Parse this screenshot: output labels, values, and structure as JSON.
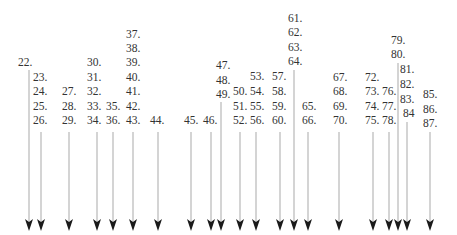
{
  "colors": {
    "text": "#333333",
    "line": "#b8b8b8",
    "arrowhead": "#1a1a1a",
    "background": "#ffffff"
  },
  "labels": [
    {
      "text": "22.",
      "x": 18,
      "y": 57
    },
    {
      "text": "23.",
      "x": 33,
      "y": 72
    },
    {
      "text": "24.",
      "x": 33,
      "y": 86
    },
    {
      "text": "25.",
      "x": 33,
      "y": 101
    },
    {
      "text": "26.",
      "x": 33,
      "y": 115
    },
    {
      "text": "27.",
      "x": 62,
      "y": 86
    },
    {
      "text": "28.",
      "x": 62,
      "y": 101
    },
    {
      "text": "29.",
      "x": 62,
      "y": 115
    },
    {
      "text": "30.",
      "x": 87,
      "y": 57
    },
    {
      "text": "31.",
      "x": 87,
      "y": 72
    },
    {
      "text": "32.",
      "x": 87,
      "y": 86
    },
    {
      "text": "33.",
      "x": 87,
      "y": 101
    },
    {
      "text": "34.",
      "x": 87,
      "y": 115
    },
    {
      "text": "35.",
      "x": 106,
      "y": 101
    },
    {
      "text": "36.",
      "x": 106,
      "y": 115
    },
    {
      "text": "37.",
      "x": 126,
      "y": 29
    },
    {
      "text": "38.",
      "x": 126,
      "y": 43
    },
    {
      "text": "39.",
      "x": 126,
      "y": 57
    },
    {
      "text": "40.",
      "x": 126,
      "y": 72
    },
    {
      "text": "41.",
      "x": 126,
      "y": 86
    },
    {
      "text": "42.",
      "x": 126,
      "y": 101
    },
    {
      "text": "43.",
      "x": 126,
      "y": 115
    },
    {
      "text": "44.",
      "x": 150,
      "y": 115
    },
    {
      "text": "45.",
      "x": 184,
      "y": 115
    },
    {
      "text": "46.",
      "x": 203,
      "y": 115
    },
    {
      "text": "47.",
      "x": 216,
      "y": 60
    },
    {
      "text": "48.",
      "x": 216,
      "y": 75
    },
    {
      "text": "49.",
      "x": 216,
      "y": 89
    },
    {
      "text": "50.",
      "x": 233,
      "y": 86
    },
    {
      "text": "51.",
      "x": 233,
      "y": 101
    },
    {
      "text": "52.",
      "x": 233,
      "y": 115
    },
    {
      "text": "53.",
      "x": 250,
      "y": 71
    },
    {
      "text": "54.",
      "x": 250,
      "y": 86
    },
    {
      "text": "55.",
      "x": 250,
      "y": 101
    },
    {
      "text": "56.",
      "x": 250,
      "y": 115
    },
    {
      "text": "57.",
      "x": 272,
      "y": 71
    },
    {
      "text": "58.",
      "x": 272,
      "y": 86
    },
    {
      "text": "59.",
      "x": 272,
      "y": 101
    },
    {
      "text": "60.",
      "x": 272,
      "y": 115
    },
    {
      "text": "61.",
      "x": 288,
      "y": 13
    },
    {
      "text": "62.",
      "x": 288,
      "y": 27
    },
    {
      "text": "63.",
      "x": 288,
      "y": 42
    },
    {
      "text": "64.",
      "x": 288,
      "y": 56
    },
    {
      "text": "65.",
      "x": 302,
      "y": 101
    },
    {
      "text": "66.",
      "x": 302,
      "y": 115
    },
    {
      "text": "67.",
      "x": 333,
      "y": 72
    },
    {
      "text": "68.",
      "x": 333,
      "y": 86
    },
    {
      "text": "69.",
      "x": 333,
      "y": 101
    },
    {
      "text": "70.",
      "x": 333,
      "y": 115
    },
    {
      "text": "72.",
      "x": 365,
      "y": 72
    },
    {
      "text": "73.",
      "x": 365,
      "y": 86
    },
    {
      "text": "74.",
      "x": 365,
      "y": 101
    },
    {
      "text": "75.",
      "x": 365,
      "y": 115
    },
    {
      "text": "76.",
      "x": 382,
      "y": 86
    },
    {
      "text": "77.",
      "x": 382,
      "y": 101
    },
    {
      "text": "78.",
      "x": 382,
      "y": 115
    },
    {
      "text": "79.",
      "x": 391,
      "y": 35
    },
    {
      "text": "80.",
      "x": 391,
      "y": 49
    },
    {
      "text": "81.",
      "x": 400,
      "y": 64
    },
    {
      "text": "82.",
      "x": 400,
      "y": 79
    },
    {
      "text": "83.",
      "x": 400,
      "y": 94
    },
    {
      "text": "84",
      "x": 403,
      "y": 108
    },
    {
      "text": "85.",
      "x": 423,
      "y": 89
    },
    {
      "text": "86.",
      "x": 423,
      "y": 104
    },
    {
      "text": "87.",
      "x": 423,
      "y": 118
    }
  ],
  "arrows": [
    {
      "from": "22.",
      "x": 29,
      "y1": 70
    },
    {
      "from": "26.",
      "x": 41,
      "y1": 132
    },
    {
      "from": "29.",
      "x": 69,
      "y1": 132
    },
    {
      "from": "34.",
      "x": 97,
      "y1": 132
    },
    {
      "from": "36.",
      "x": 113,
      "y1": 132
    },
    {
      "from": "43.",
      "x": 133,
      "y1": 132
    },
    {
      "from": "44.",
      "x": 158,
      "y1": 132
    },
    {
      "from": "45.",
      "x": 191,
      "y1": 132
    },
    {
      "from": "46.",
      "x": 211,
      "y1": 132
    },
    {
      "from": "49.",
      "x": 221,
      "y1": 102
    },
    {
      "from": "52.",
      "x": 240,
      "y1": 132
    },
    {
      "from": "56.",
      "x": 256,
      "y1": 132
    },
    {
      "from": "60.",
      "x": 280,
      "y1": 132
    },
    {
      "from": "64.",
      "x": 294,
      "y1": 70
    },
    {
      "from": "66.",
      "x": 308,
      "y1": 132
    },
    {
      "from": "70.",
      "x": 339,
      "y1": 132
    },
    {
      "from": "75.",
      "x": 373,
      "y1": 132
    },
    {
      "from": "78.",
      "x": 389,
      "y1": 132
    },
    {
      "from": "80.",
      "x": 398,
      "y1": 63
    },
    {
      "from": "84",
      "x": 407,
      "y1": 122
    },
    {
      "from": "87.",
      "x": 430,
      "y1": 132
    }
  ],
  "arrow_tip_y": 231
}
